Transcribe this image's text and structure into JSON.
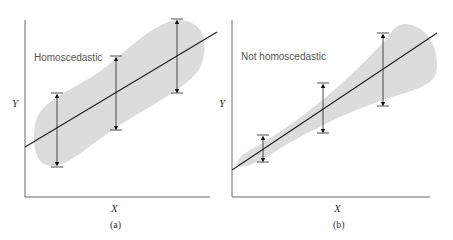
{
  "panels": [
    {
      "id": "a",
      "title": "Homoscedastic",
      "x_label": "X",
      "y_label": "Y",
      "caption": "(a)"
    },
    {
      "id": "b",
      "title": "Not homoscedastic",
      "x_label": "X",
      "y_label": "Y",
      "caption": "(b)"
    }
  ],
  "colors": {
    "band": "#dcdcdc",
    "line": "#222222",
    "axis": "#444444",
    "text": "#555555"
  }
}
